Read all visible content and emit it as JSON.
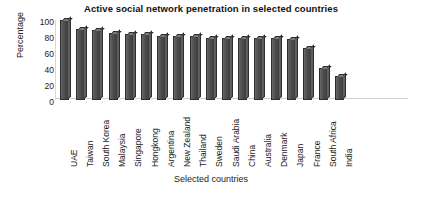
{
  "chart_data": {
    "type": "bar",
    "title": "Active social network penetration in selected countries",
    "xlabel": "Selected countries",
    "ylabel": "Percentage",
    "ylim": [
      0,
      100
    ],
    "yticks": [
      100,
      80,
      60,
      40,
      20,
      0
    ],
    "grid": false,
    "legend": null,
    "categories": [
      "UAE",
      "Taiwan",
      "South Korea",
      "Malaysia",
      "Singapore",
      "Hongkong",
      "Argentina",
      "New Zealand",
      "Thailand",
      "Sweden",
      "Saudi Arabia",
      "China",
      "Australia",
      "Denmark",
      "Japan",
      "France",
      "South Africa",
      "India"
    ],
    "values": [
      100,
      89,
      88,
      84,
      83,
      82,
      80,
      80,
      80,
      78,
      78,
      78,
      77,
      77,
      76,
      65,
      40,
      30
    ],
    "bar_color": "#4a4a4a",
    "bar_edge_color": "#2e2e2e",
    "background_color": "#ffffff"
  }
}
